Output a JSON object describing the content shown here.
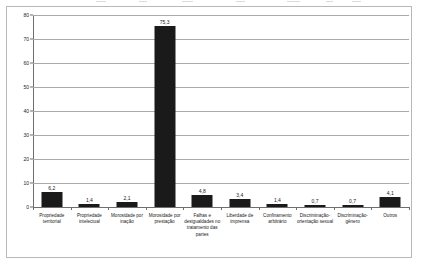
{
  "chart_data": {
    "type": "bar",
    "title": "",
    "subtitle": "",
    "xlabel": "",
    "ylabel": "",
    "ylim": [
      0,
      80
    ],
    "yticks": [
      0,
      10,
      20,
      30,
      40,
      50,
      60,
      70,
      80
    ],
    "ytick_labels": [
      "0",
      "10",
      "20",
      "30",
      "40",
      "50",
      "60",
      "70",
      "80"
    ],
    "grid": true,
    "legend": false,
    "legend_position": "none",
    "bar_color": "#1a1a1a",
    "gridline_color": "#a9a9a9",
    "axis_color": "#6e6e6e",
    "decimal_separator": ",",
    "categories": [
      "Propriedade territorial",
      "Propriedade intelectual",
      "Morosidade por inação",
      "Morosidade por prestação",
      "Falhas e desigualdades no tratamento das partes",
      "Liberdade de imprensa",
      "Confinamento arbitrário",
      "Discriminação-orientação sexual",
      "Discriminação-gênero",
      "Outros"
    ],
    "values": [
      6.2,
      1.4,
      2.1,
      75.3,
      4.8,
      3.4,
      1.4,
      0.7,
      0.7,
      4.1
    ],
    "data_labels": [
      "6,2",
      "1,4",
      "2,1",
      "75,3",
      "4,8",
      "3,4",
      "1,4",
      "0,7",
      "0,7",
      "4,1"
    ]
  }
}
